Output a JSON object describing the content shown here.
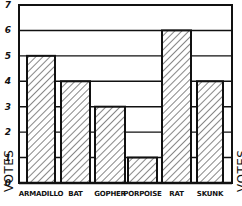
{
  "chart_data": {
    "type": "bar",
    "title": "",
    "xlabel": "",
    "ylabel": "VOTES",
    "ylabel_right": "VOTES",
    "categories": [
      "ARMADILLO",
      "BAT",
      "GOPHER",
      "PORPOISE",
      "RAT",
      "SKUNK"
    ],
    "values": [
      5,
      4,
      3,
      1,
      6,
      4
    ],
    "ylim": [
      0,
      7
    ],
    "yticks": [
      0,
      1,
      2,
      3,
      4,
      5,
      6,
      7
    ],
    "grid": true,
    "legend": null,
    "style": "hand-drawn, diagonal hatched bars, black ink on white"
  },
  "colors": {
    "ink": "#111111",
    "background": "#ffffff"
  }
}
